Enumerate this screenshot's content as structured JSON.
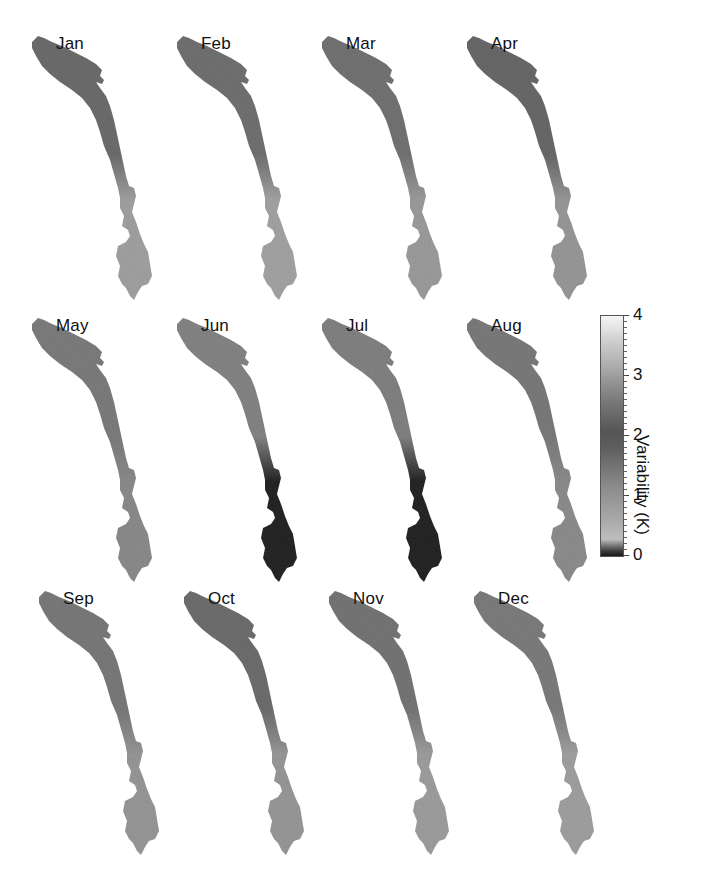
{
  "chart_data": {
    "type": "heatmap",
    "title": "",
    "panels": [
      {
        "label": "Jan",
        "north_mean_K": 2.0,
        "south_mean_K": 0.7
      },
      {
        "label": "Feb",
        "north_mean_K": 2.1,
        "south_mean_K": 0.7
      },
      {
        "label": "Mar",
        "north_mean_K": 2.0,
        "south_mean_K": 0.8
      },
      {
        "label": "Apr",
        "north_mean_K": 2.3,
        "south_mean_K": 1.0
      },
      {
        "label": "May",
        "north_mean_K": 1.7,
        "south_mean_K": 1.2
      },
      {
        "label": "Jun",
        "north_mean_K": 1.5,
        "south_mean_K": 0.1
      },
      {
        "label": "Jul",
        "north_mean_K": 1.6,
        "south_mean_K": 0.1
      },
      {
        "label": "Aug",
        "north_mean_K": 1.7,
        "south_mean_K": 0.6
      },
      {
        "label": "Sep",
        "north_mean_K": 1.8,
        "south_mean_K": 0.9
      },
      {
        "label": "Oct",
        "north_mean_K": 2.0,
        "south_mean_K": 0.9
      },
      {
        "label": "Nov",
        "north_mean_K": 1.9,
        "south_mean_K": 0.8
      },
      {
        "label": "Dec",
        "north_mean_K": 1.7,
        "south_mean_K": 0.7
      }
    ],
    "colorbar": {
      "label": "Variability (K)",
      "ticks": [
        0,
        1,
        2,
        3,
        4
      ],
      "range": [
        0,
        4
      ],
      "colormap": "grayscale (dark at 0, light ~0.3, darkest ~2, white at 4)"
    },
    "layout": {
      "rows": 3,
      "cols": 4,
      "legend_position": "right of row 2"
    }
  },
  "colorbar": {
    "title": "Variability (K)",
    "ticks": [
      "0",
      "1",
      "2",
      "3",
      "4"
    ]
  },
  "months": [
    "Jan",
    "Feb",
    "Mar",
    "Apr",
    "May",
    "Jun",
    "Jul",
    "Aug",
    "Sep",
    "Oct",
    "Nov",
    "Dec"
  ],
  "colors": {
    "north": [
      "#6e6e6e",
      "#727272",
      "#747474",
      "#6a6a6a",
      "#7e7e7e",
      "#868686",
      "#838383",
      "#7c7c7c",
      "#7b7b7b",
      "#6f6f6f",
      "#777777",
      "#7e7e7e"
    ],
    "south": [
      "#a3a3a3",
      "#a5a5a5",
      "#9e9e9e",
      "#9a9a9a",
      "#8d8d8d",
      "#262626",
      "#262626",
      "#8f8f8f",
      "#999999",
      "#9a9a9a",
      "#a0a0a0",
      "#a2a2a2"
    ]
  }
}
